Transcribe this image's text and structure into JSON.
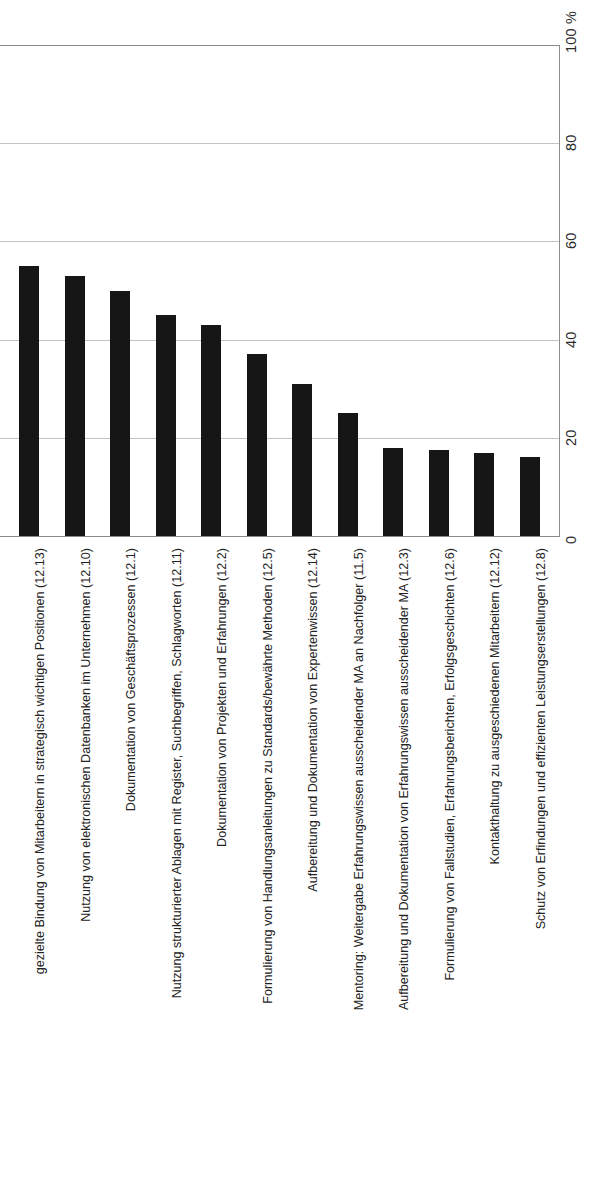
{
  "chart_data": {
    "type": "bar",
    "orientation": "vertical-bars-rotated-page",
    "title": "",
    "subtitle": "",
    "xlabel": "",
    "ylabel": "",
    "unit_label": "100 %",
    "ylim": [
      0,
      100
    ],
    "grid": true,
    "gridlines": [
      0,
      20,
      40,
      60,
      80,
      100
    ],
    "legend": null,
    "bar_color": "#161616",
    "gridline_color": "#b8b8b8",
    "axis_color": "#8c8c8c",
    "yticks": [
      "0",
      "20",
      "40",
      "60",
      "80",
      "100 %"
    ],
    "ytick_values": [
      0,
      20,
      40,
      60,
      80,
      100
    ],
    "categories": [
      "gezielte Bindung von Mitarbeitern in strategisch wichtigen Positionen (12.13)",
      "Nutzung von elektronischen Datenbanken im Unternehmen (12.10)",
      "Dokumentation von Geschäftsprozessen (12.1)",
      "Nutzung strukturierter Ablagen mit Register, Suchbegriffen, Schlagworten (12.11)",
      "Dokumentation von Projekten und Erfahrungen (12.2)",
      "Formulierung von Handlungsanleitungen zu Standards/bewährte Methoden (12.5)",
      "Aufbereitung und Dokumentation von Expertenwissen (12.14)",
      "Mentoring: Weitergabe Erfahrungswissen ausscheidender MA an Nachfolger (11.5)",
      "Aufbereitung und Dokumentation von Erfahrungswissen ausscheidender MA (12.3)",
      "Formulierung von Fallstudien, Erfahrungsberichten, Erfolgsgeschichten (12.6)",
      "Kontakthaltung zu ausgeschiedenen Mitarbeitern (12.12)",
      "Schutz von Erfindungen und effizienten Leistungserstellungen (12.8)"
    ],
    "values": [
      55,
      53,
      50,
      45,
      43,
      37,
      31,
      25,
      18,
      17.5,
      17,
      16
    ]
  }
}
